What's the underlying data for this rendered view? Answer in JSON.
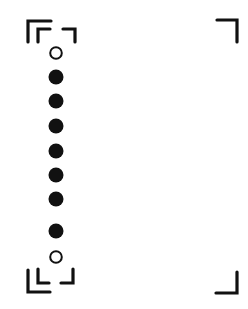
{
  "figure": {
    "colors": {
      "ink": "#111111",
      "background": "#ffffff"
    },
    "dots": [
      {
        "type": "open",
        "cx": 56,
        "cy": 53
      },
      {
        "type": "filled",
        "cx": 56,
        "cy": 77
      },
      {
        "type": "filled",
        "cx": 56,
        "cy": 101
      },
      {
        "type": "filled",
        "cx": 56,
        "cy": 126
      },
      {
        "type": "filled",
        "cx": 56,
        "cy": 151
      },
      {
        "type": "filled",
        "cx": 56,
        "cy": 175
      },
      {
        "type": "filled",
        "cx": 56,
        "cy": 199
      },
      {
        "type": "filled",
        "cx": 56,
        "cy": 231
      },
      {
        "type": "open",
        "cx": 56,
        "cy": 257
      }
    ],
    "brackets": [
      {
        "name": "top-left-outer",
        "d": "M28 42 V21 H51"
      },
      {
        "name": "top-left-inner",
        "d": "M38 42 V29 H50"
      },
      {
        "name": "top-left-small",
        "d": "M63 29 H75 V42"
      },
      {
        "name": "top-right",
        "d": "M217 20 H237 V42"
      },
      {
        "name": "bottom-left-outer",
        "d": "M28 270 V292 H50"
      },
      {
        "name": "bottom-left-inner",
        "d": "M38 269 V283 H49"
      },
      {
        "name": "bottom-left-small",
        "d": "M61 283 H73 V269"
      },
      {
        "name": "bottom-right",
        "d": "M237 272 V293 H216"
      }
    ]
  }
}
